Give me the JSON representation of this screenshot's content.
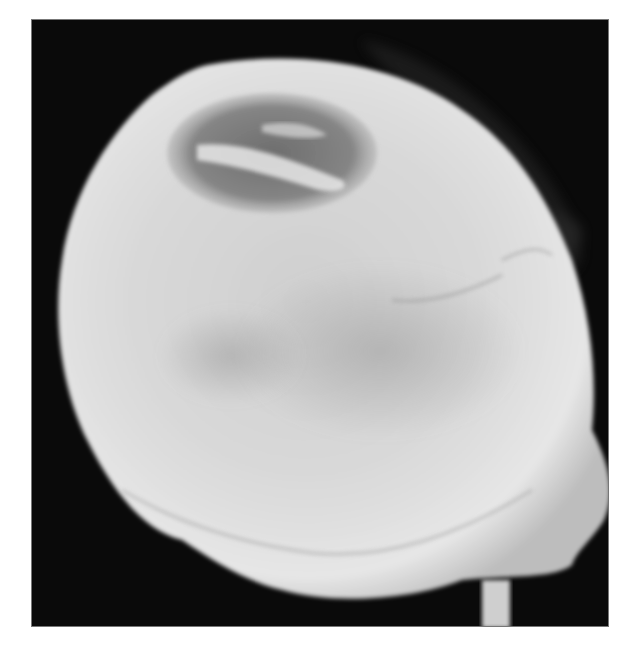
{
  "figure": {
    "colors": {
      "background": "#0a0a0a",
      "bone": "#d8d8d8",
      "lesion": "#707070",
      "page": "#ffffff"
    }
  }
}
